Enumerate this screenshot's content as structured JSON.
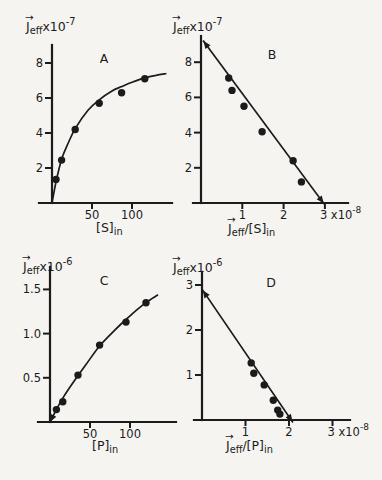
{
  "figure": {
    "background": "#f5f4f1",
    "ink": "#1b1b1b",
    "description_panels": [
      "A",
      "B",
      "C",
      "D"
    ]
  },
  "chart_data": [
    {
      "panel": "A",
      "type": "scatter",
      "title": "A",
      "xlabel": "[S]in",
      "ylabel": "J_eff x10^-7",
      "xlim": [
        0,
        150
      ],
      "ylim": [
        0,
        9
      ],
      "grid": false,
      "x_ticks": [
        {
          "v": 50,
          "label": "50"
        },
        {
          "v": 100,
          "label": "100"
        }
      ],
      "y_ticks": [
        {
          "v": 2,
          "label": "2"
        },
        {
          "v": 4,
          "label": "4"
        },
        {
          "v": 6,
          "label": "6"
        },
        {
          "v": 8,
          "label": "8"
        }
      ],
      "ylabel_segments": [
        {
          "t": "J",
          "arrow": true
        },
        {
          "t": "eff",
          "sub": true
        },
        {
          "t": " x10"
        },
        {
          "t": "-7",
          "sup": true
        }
      ],
      "xlabel_segments": [
        {
          "t": "[S]"
        },
        {
          "t": "in",
          "sub": true
        }
      ],
      "points": [
        [
          5,
          1.35
        ],
        [
          12,
          2.45
        ],
        [
          29,
          4.2
        ],
        [
          59,
          5.7
        ],
        [
          87,
          6.3
        ],
        [
          116,
          7.1
        ]
      ],
      "curve": [
        [
          0,
          0
        ],
        [
          5,
          1.2
        ],
        [
          12,
          2.5
        ],
        [
          20,
          3.4
        ],
        [
          29,
          4.25
        ],
        [
          45,
          5.3
        ],
        [
          59,
          5.9
        ],
        [
          75,
          6.4
        ],
        [
          87,
          6.65
        ],
        [
          100,
          6.9
        ],
        [
          116,
          7.15
        ],
        [
          130,
          7.3
        ],
        [
          143,
          7.4
        ]
      ],
      "curve_start_arrow": false
    },
    {
      "panel": "B",
      "type": "scatter",
      "title": "B",
      "xlabel": "J_eff/[S]in",
      "ylabel": "J_eff x10^-7",
      "xlim": [
        0,
        3.55
      ],
      "ylim": [
        0,
        9.5
      ],
      "grid": false,
      "x_ticks": [
        {
          "v": 1,
          "label": "1"
        },
        {
          "v": 2,
          "label": "2"
        },
        {
          "v": 3,
          "segments": [
            {
              "t": "3 x10"
            },
            {
              "t": "-8",
              "sup": true
            }
          ]
        }
      ],
      "y_ticks": [
        {
          "v": 2,
          "label": "2"
        },
        {
          "v": 4,
          "label": "4"
        },
        {
          "v": 6,
          "label": "6"
        },
        {
          "v": 8,
          "label": "8"
        }
      ],
      "ylabel_segments": [
        {
          "t": "J",
          "arrow": true
        },
        {
          "t": "eff",
          "sub": true
        },
        {
          "t": " x10"
        },
        {
          "t": "-7",
          "sup": true
        }
      ],
      "xlabel_segments": [
        {
          "t": "J",
          "arrow": true
        },
        {
          "t": "eff",
          "sub": true
        },
        {
          "t": "/[S]"
        },
        {
          "t": "in",
          "sub": true
        }
      ],
      "points": [
        [
          0.67,
          7.1
        ],
        [
          0.75,
          6.4
        ],
        [
          1.04,
          5.5
        ],
        [
          1.48,
          4.05
        ],
        [
          2.23,
          2.4
        ],
        [
          2.43,
          1.2
        ]
      ],
      "line": {
        "from": [
          0.06,
          9.2
        ],
        "to": [
          2.97,
          -0.02
        ],
        "arrow_start": true,
        "arrow_end": true
      }
    },
    {
      "panel": "C",
      "type": "scatter",
      "title": "C",
      "xlabel": "[P]in",
      "ylabel": "J_eff x10^-6",
      "xlim": [
        0,
        157
      ],
      "ylim": [
        0,
        1.75
      ],
      "grid": false,
      "x_ticks": [
        {
          "v": 50,
          "label": "50"
        },
        {
          "v": 100,
          "label": "100"
        }
      ],
      "y_ticks": [
        {
          "v": 0.5,
          "label": "0.5"
        },
        {
          "v": 1.0,
          "label": "1.0"
        },
        {
          "v": 1.5,
          "label": "1.5"
        }
      ],
      "ylabel_segments": [
        {
          "t": "J",
          "arrow": true
        },
        {
          "t": "eff",
          "sub": true
        },
        {
          "t": " x10"
        },
        {
          "t": "-6",
          "sup": true
        }
      ],
      "xlabel_segments": [
        {
          "t": "[P]"
        },
        {
          "t": "in",
          "sub": true
        }
      ],
      "points": [
        [
          8,
          0.14
        ],
        [
          16,
          0.23
        ],
        [
          35,
          0.53
        ],
        [
          62,
          0.87
        ],
        [
          95,
          1.13
        ],
        [
          120,
          1.35
        ]
      ],
      "curve": [
        [
          0,
          0
        ],
        [
          8,
          0.14
        ],
        [
          16,
          0.27
        ],
        [
          30,
          0.46
        ],
        [
          45,
          0.65
        ],
        [
          62,
          0.86
        ],
        [
          80,
          1.03
        ],
        [
          95,
          1.16
        ],
        [
          110,
          1.28
        ],
        [
          123,
          1.37
        ],
        [
          135,
          1.44
        ]
      ],
      "curve_start_arrow": true
    },
    {
      "panel": "D",
      "type": "scatter",
      "title": "D",
      "xlabel": "J_eff/[P]in",
      "ylabel": "J_eff x10^-6",
      "xlim": [
        0,
        3.4
      ],
      "ylim": [
        0,
        3.3
      ],
      "grid": false,
      "x_ticks": [
        {
          "v": 1,
          "label": "1"
        },
        {
          "v": 2,
          "label": "2"
        },
        {
          "v": 3,
          "segments": [
            {
              "t": "3 x10"
            },
            {
              "t": "-8",
              "sup": true
            }
          ]
        }
      ],
      "y_ticks": [
        {
          "v": 1,
          "label": "1"
        },
        {
          "v": 2,
          "label": "2"
        },
        {
          "v": 3,
          "label": "3"
        }
      ],
      "ylabel_segments": [
        {
          "t": "J",
          "arrow": true
        },
        {
          "t": "eff",
          "sub": true
        },
        {
          "t": " x10"
        },
        {
          "t": "-6",
          "sup": true
        }
      ],
      "xlabel_segments": [
        {
          "t": "J",
          "arrow": true
        },
        {
          "t": "eff",
          "sub": true
        },
        {
          "t": "/[P]"
        },
        {
          "t": "in",
          "sub": true
        }
      ],
      "points": [
        [
          1.13,
          1.27
        ],
        [
          1.19,
          1.04
        ],
        [
          1.43,
          0.78
        ],
        [
          1.64,
          0.44
        ],
        [
          1.74,
          0.22
        ],
        [
          1.79,
          0.13
        ]
      ],
      "line": {
        "from": [
          0.02,
          2.88
        ],
        "to": [
          2.08,
          -0.04
        ],
        "arrow_start": true,
        "arrow_end": true
      }
    }
  ]
}
